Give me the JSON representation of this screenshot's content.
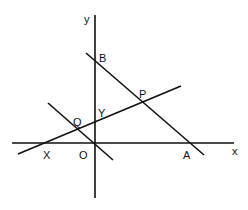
{
  "diagram": {
    "type": "coordinate-geometry",
    "stroke_color": "#111111",
    "background": "#ffffff",
    "axes": {
      "x_label": "x",
      "y_label": "y",
      "origin_label": "O"
    },
    "points": {
      "A": "A",
      "B": "B",
      "P": "P",
      "Q": "Q",
      "X": "X",
      "Y": "Y",
      "O": "O"
    },
    "lines": [
      {
        "name": "AB",
        "through": [
          "B",
          "P",
          "A"
        ]
      },
      {
        "name": "XP",
        "through": [
          "X",
          "Q",
          "Y",
          "P"
        ]
      },
      {
        "name": "OQ",
        "through": [
          "Q",
          "O"
        ]
      }
    ]
  }
}
